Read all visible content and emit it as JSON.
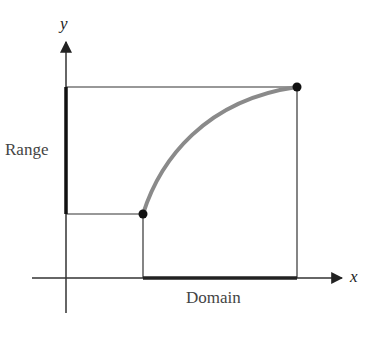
{
  "diagram": {
    "title": "",
    "axes": {
      "x_label": "x",
      "y_label": "y"
    },
    "labels": {
      "range": "Range",
      "domain": "Domain"
    },
    "points": {
      "start": {
        "x": 143,
        "y": 214
      },
      "end": {
        "x": 297,
        "y": 87
      }
    },
    "colors": {
      "axis": "#333333",
      "curve": "#8a8a8a",
      "point": "#111111",
      "highlight_interval": "#222222"
    }
  }
}
